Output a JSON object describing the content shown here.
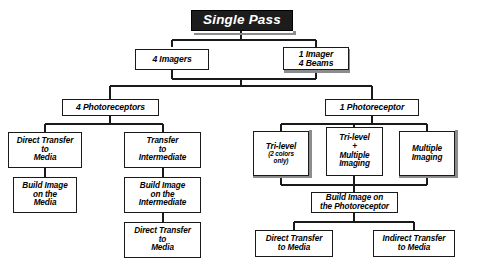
{
  "diagram": {
    "title": "Single Pass",
    "type": "hierarchical-tree-diagram",
    "colors": {
      "root_fill": "#1c1c1c",
      "root_text": "#ffffff",
      "node_fill": "#ffffff",
      "node_border": "#1a1a1a",
      "shadow": "#8c8c8c",
      "background": "#ffffff"
    }
  },
  "nodes": {
    "root": {
      "label": "Single Pass"
    },
    "level1": [
      {
        "id": "four-imagers",
        "label": "4 Imagers"
      },
      {
        "id": "one-imager-four-beams",
        "line1": "1 Imager",
        "line2": "4 Beams"
      }
    ],
    "level2": [
      {
        "id": "four-photoreceptors",
        "label": "4 Photoreceptors"
      },
      {
        "id": "one-photoreceptor",
        "label": "1 Photoreceptor"
      }
    ],
    "left_branch": {
      "direct_transfer": {
        "line1": "Direct Transfer",
        "line2": "to",
        "line3": "Media"
      },
      "build_image_media": {
        "line1": "Build Image",
        "line2": "on the",
        "line3": "Media"
      },
      "transfer_intermediate": {
        "line1": "Transfer",
        "line2": "to",
        "line3": "Intermediate"
      },
      "build_image_intermediate": {
        "line1": "Build Image",
        "line2": "on the",
        "line3": "Intermediate"
      },
      "direct_transfer_media2": {
        "line1": "Direct Transfer",
        "line2": "to",
        "line3": "Media"
      }
    },
    "right_branch": {
      "tri_level": {
        "line1": "Tri-level",
        "line2": "(2 colors",
        "line3": "only)"
      },
      "tri_level_multiple": {
        "line1": "Tri-level",
        "line2": "+",
        "line3": "Multiple",
        "line4": "Imaging"
      },
      "multiple_imaging": {
        "line1": "Multiple",
        "line2": "Imaging"
      },
      "build_image_photoreceptor": {
        "line1": "Build Image on",
        "line2": "the Photoreceptor"
      },
      "direct_transfer_media": {
        "line1": "Direct Transfer",
        "line2": "to Media"
      },
      "indirect_transfer_media": {
        "line1": "Indirect Transfer",
        "line2": "to Media"
      }
    }
  }
}
